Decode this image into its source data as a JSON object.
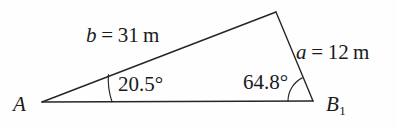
{
  "figure": {
    "name": "triangle-diagram",
    "background_color": "#fefefe",
    "stroke_color": "#262626"
  },
  "vertices": {
    "a": {
      "label": "A",
      "x": 42,
      "y": 102
    },
    "b": {
      "label": "B",
      "subscript": "1",
      "x": 313,
      "y": 101
    },
    "c": {
      "label": "",
      "x": 276,
      "y": 12
    }
  },
  "sides": {
    "b": {
      "variable": "b",
      "equals": "=",
      "value": "31",
      "unit": "m",
      "text": "b = 31 m"
    },
    "a": {
      "variable": "a",
      "equals": "=",
      "value": "12",
      "unit": "m",
      "text": "a = 12 m"
    }
  },
  "angles": {
    "at_a": {
      "value": "20.5",
      "degree": "°",
      "text": "20.5°"
    },
    "at_b": {
      "value": "64.8",
      "degree": "°",
      "text": "64.8°"
    }
  },
  "geometry": {
    "baseline_path": "M 42 102 L 313 101",
    "side_b_path": "M 42 102 L 276 12",
    "side_a_path": "M 276 12 L 313 101",
    "arc_at_a_path": "M 112 101.8 A 70 70 0 0 1 108.4 74.6",
    "arc_at_b_path": "M 288 101.1 A 26 26 0 0 1 302.2 77.9"
  }
}
